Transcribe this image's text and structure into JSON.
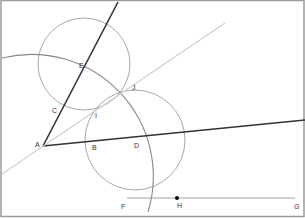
{
  "diagram": {
    "colors": {
      "frame": "#9a9a9a",
      "dark_line": "#333333",
      "light_line": "#cfcfcf",
      "circle": "#a8a8a8",
      "point": "#000000"
    },
    "points": {
      "A": {
        "label": "A",
        "x": 43,
        "y": 146
      },
      "B": {
        "label": "B",
        "x": 92,
        "y": 141
      },
      "C": {
        "label": "C",
        "x": 60,
        "y": 112
      },
      "D": {
        "label": "D",
        "x": 134,
        "y": 140
      },
      "E": {
        "label": "E",
        "x": 84,
        "y": 65
      },
      "F": {
        "label": "F",
        "x": 125,
        "y": 203
      },
      "G": {
        "label": "G",
        "x": 296,
        "y": 203
      },
      "H": {
        "label": "H",
        "x": 177,
        "y": 198
      },
      "I": {
        "label": "I",
        "x": 95,
        "y": 114
      },
      "J": {
        "label": "J",
        "x": 134,
        "y": 92
      }
    },
    "segments": [
      {
        "name": "ray-ae",
        "x1": 43,
        "y1": 146,
        "x2": 118,
        "y2": 2,
        "style": "dark"
      },
      {
        "name": "ray-ad",
        "x1": 43,
        "y1": 146,
        "x2": 305,
        "y2": 120,
        "style": "dark"
      },
      {
        "name": "bisector",
        "x1": 2,
        "y1": 174,
        "x2": 225,
        "y2": 23,
        "style": "light"
      },
      {
        "name": "segment-fg",
        "x1": 127,
        "y1": 198,
        "x2": 295,
        "y2": 198,
        "style": "thin"
      }
    ],
    "circles": [
      {
        "name": "circle-e",
        "cx": 84,
        "cy": 64,
        "r": 46
      },
      {
        "name": "circle-d",
        "cx": 135,
        "cy": 140,
        "r": 50
      }
    ],
    "arcs": [
      {
        "name": "arc-a",
        "d": "M 2 58 A 122 122 0 0 1 148 212"
      }
    ]
  }
}
